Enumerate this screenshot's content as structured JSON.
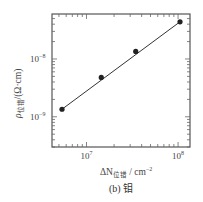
{
  "chart_data": {
    "type": "scatter",
    "subtype": "log-log scatter with linear fit",
    "title": "",
    "caption": "(b) 钼",
    "xlabel": "ΔN位错 / cm⁻²",
    "xlabel_main": "ΔN",
    "xlabel_sub": "位错",
    "xlabel_unit": " / cm",
    "xlabel_unit_exp": "−2",
    "ylabel": "ρ位错/(Ω·cm)",
    "ylabel_main": "ρ",
    "ylabel_sub": "位错",
    "ylabel_unit": "/(Ω·cm)",
    "xscale": "log",
    "yscale": "log",
    "xlim": [
      4200000.0,
      135000000.0
    ],
    "ylim": [
      3e-10,
      6e-08
    ],
    "x_ticks": [
      {
        "base": "10",
        "exp": "7",
        "value": 10000000.0
      },
      {
        "base": "10",
        "exp": "8",
        "value": 100000000.0
      }
    ],
    "y_ticks": [
      {
        "base": "10",
        "exp": "−8",
        "value": 1e-08
      },
      {
        "base": "10",
        "exp": "−9",
        "value": 1e-09
      }
    ],
    "grid": false,
    "legend": null,
    "series": [
      {
        "name": "钼",
        "marker": "filled-circle",
        "line": "linear fit",
        "x": [
          5400000.0,
          14500000.0,
          34500000.0,
          105000000.0
        ],
        "y": [
          1.35e-09,
          4.8e-09,
          1.35e-08,
          4.4e-08
        ]
      }
    ]
  }
}
